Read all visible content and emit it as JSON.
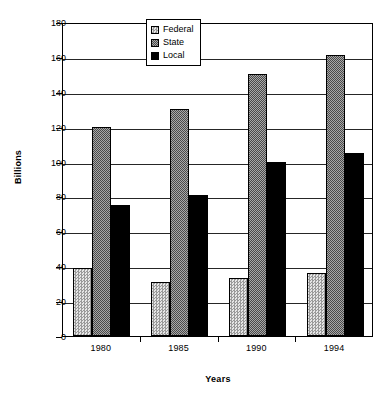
{
  "chart_data": {
    "type": "bar",
    "title": "",
    "xlabel": "Years",
    "ylabel": "Billions",
    "categories": [
      "1980",
      "1985",
      "1990",
      "1994"
    ],
    "series": [
      {
        "name": "Federal",
        "values": [
          39,
          31,
          33,
          36
        ],
        "pattern": "light-checker",
        "color": "#c8c8c8"
      },
      {
        "name": "State",
        "values": [
          120,
          130,
          150,
          161
        ],
        "pattern": "dark-checker",
        "color": "#787878"
      },
      {
        "name": "Local",
        "values": [
          75,
          81,
          100,
          105
        ],
        "pattern": "solid",
        "color": "#000000"
      }
    ],
    "ylim": [
      0,
      180
    ],
    "ytick_step": 20,
    "yticks": [
      "180",
      "160",
      "140",
      "120",
      "100",
      "80",
      "60",
      "40",
      "20",
      "0"
    ],
    "grid": "horizontal",
    "legend_position": "top-center-inside",
    "legend_entries": [
      "Federal",
      "State",
      "Local"
    ]
  }
}
